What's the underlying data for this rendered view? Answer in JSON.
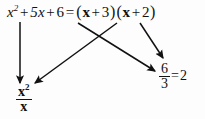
{
  "figure": {
    "background_color": "#fdfdfd",
    "ink_color": "#111111"
  },
  "equation": {
    "left_side": {
      "term1_base": "x",
      "term1_exponent": "2",
      "op1": "+",
      "term2": "5x",
      "op2": "+",
      "term3": "6"
    },
    "relation": "=",
    "right_side": {
      "open_paren_1": "(",
      "factor1_var": "x",
      "factor1_op": "+",
      "factor1_const": "3",
      "close_paren_1": ")",
      "open_paren_2": "(",
      "factor2_var": "x",
      "factor2_op": "+",
      "factor2_const": "2",
      "close_paren_2": ")"
    },
    "full_text": "x² + 5x + 6 = ( x + 3 ) ( x + 2 )"
  },
  "annotations": {
    "left_result": {
      "numerator_base": "x",
      "numerator_exponent": "2",
      "denominator": "x",
      "full_text": "x² / x"
    },
    "right_result": {
      "numerator": "6",
      "denominator": "3",
      "relation": "=",
      "value": "2",
      "full_text": "6 / 3 = 2"
    }
  },
  "arrows": [
    {
      "name": "arrow-x-squared-to-left-fraction",
      "from": "x² term of left side",
      "to": "x²/x fraction",
      "x1": 20,
      "y1": 22,
      "x2": 20,
      "y2": 84
    },
    {
      "name": "arrow-six-to-right-fraction",
      "from": "constant 6 of left side",
      "to": "6/3 fraction",
      "x1": 78,
      "y1": 22,
      "x2": 156,
      "y2": 71
    },
    {
      "name": "arrow-factor-x-to-left-fraction",
      "from": "x in (x+3)",
      "to": "x²/x fraction",
      "x1": 116,
      "y1": 22,
      "x2": 34,
      "y2": 83
    },
    {
      "name": "arrow-factor-three-to-right-fraction",
      "from": "3 in (x+3) / (x+2) region",
      "to": "6/3 fraction",
      "x1": 140,
      "y1": 22,
      "x2": 162,
      "y2": 58
    }
  ]
}
